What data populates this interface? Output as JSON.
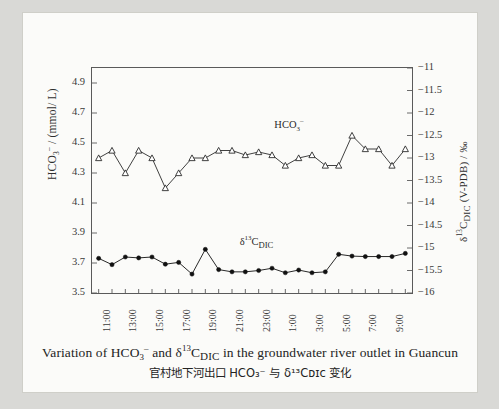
{
  "figure": {
    "caption_en_part1": "Variation of HCO",
    "caption_en_sub1": "3",
    "caption_en_sup1": "–",
    "caption_en_part2": " and ",
    "caption_en_delta": "δ",
    "caption_en_sup2": "13",
    "caption_en_c": "C",
    "caption_en_sub2": "DIC",
    "caption_en_part3": " in the groundwater river outlet in Guancun",
    "caption_zh": "官村地下河出口 HCO₃⁻ 与 δ¹³Cᴅɪᴄ 变化"
  },
  "chart_data": {
    "type": "line",
    "title": "",
    "xlabel": "",
    "ylabel": "HCO3- / (mmol/L)",
    "ylabel_right": "d13C_DIC (V-PDB) / ‰",
    "grid": false,
    "legend": "in-plot labels",
    "ylim": [
      3.5,
      5.0
    ],
    "ylim_right": [
      -16,
      -11
    ],
    "ytick_labels_left": [
      "4.9",
      "4.7",
      "4.5",
      "4.3",
      "4.1",
      "3.9",
      "3.7",
      "3.5"
    ],
    "ytick_values_left": [
      4.9,
      4.7,
      4.5,
      4.3,
      4.1,
      3.9,
      3.7,
      3.5
    ],
    "ytick_labels_right": [
      "−11",
      "−11.5",
      "−12",
      "−12.5",
      "−13",
      "−13.5",
      "−14",
      "−14.5",
      "−15",
      "−15.5",
      "−16"
    ],
    "ytick_values_right": [
      -11,
      -11.5,
      -12,
      -12.5,
      -13,
      -13.5,
      -14,
      -14.5,
      -15,
      -15.5,
      -16
    ],
    "x": [
      "11:00",
      "12:00",
      "13:00",
      "14:00",
      "15:00",
      "16:00",
      "17:00",
      "18:00",
      "19:00",
      "20:00",
      "21:00",
      "22:00",
      "23:00",
      "0:00",
      "1:00",
      "2:00",
      "3:00",
      "4:00",
      "5:00",
      "6:00",
      "7:00",
      "8:00",
      "9:00",
      "10:00"
    ],
    "xtick_labels": [
      "11:00",
      "13:00",
      "15:00",
      "17:00",
      "19:00",
      "21:00",
      "23:00",
      "1:00",
      "3:00",
      "5:00",
      "7:00",
      "9:00"
    ],
    "xtick_label_indices": [
      0,
      2,
      4,
      6,
      8,
      10,
      12,
      14,
      16,
      18,
      20,
      22
    ],
    "series": [
      {
        "name": "HCO3-",
        "label": "HCO3-",
        "axis": "left",
        "marker": "open-triangle",
        "color": "#2b2b2b",
        "values": [
          4.4,
          4.45,
          4.3,
          4.45,
          4.4,
          4.2,
          4.3,
          4.4,
          4.4,
          4.45,
          4.45,
          4.42,
          4.44,
          4.42,
          4.35,
          4.4,
          4.42,
          4.35,
          4.35,
          4.55,
          4.46,
          4.46,
          4.35,
          4.46
        ]
      },
      {
        "name": "d13C_DIC",
        "label": "d13C_DIC",
        "axis": "right",
        "marker": "filled-circle",
        "color": "#111111",
        "values": [
          -15.23,
          -15.37,
          -15.2,
          -15.22,
          -15.2,
          -15.36,
          -15.32,
          -15.58,
          -15.03,
          -15.48,
          -15.53,
          -15.53,
          -15.5,
          -15.45,
          -15.55,
          -15.49,
          -15.55,
          -15.53,
          -15.14,
          -15.18,
          -15.19,
          -15.19,
          -15.19,
          -15.12
        ]
      }
    ],
    "annotations": [
      {
        "text": "HCO3-",
        "x_index": 14,
        "y": 4.62
      },
      {
        "text": "d13C_DIC",
        "x_index": 12,
        "y": 3.84
      }
    ]
  }
}
